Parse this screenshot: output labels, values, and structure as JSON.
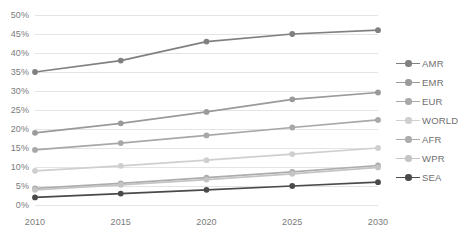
{
  "chart_data": {
    "type": "line",
    "title": "",
    "xlabel": "",
    "ylabel": "",
    "categories": [
      "2010",
      "2015",
      "2020",
      "2025",
      "2030"
    ],
    "x": [
      2010,
      2015,
      2020,
      2025,
      2030
    ],
    "ylim": [
      0,
      50
    ],
    "ytick_labels": [
      "0%",
      "5%",
      "10%",
      "15%",
      "20%",
      "25%",
      "30%",
      "35%",
      "40%",
      "45%",
      "50%"
    ],
    "ytick_values": [
      0,
      5,
      10,
      15,
      20,
      25,
      30,
      35,
      40,
      45,
      50
    ],
    "grid": true,
    "legend_position": "right",
    "series": [
      {
        "name": "AMR",
        "color": "#808080",
        "values": [
          35.0,
          38.0,
          43.0,
          45.0,
          46.0
        ]
      },
      {
        "name": "EMR",
        "color": "#9a9a9a",
        "values": [
          19.0,
          21.5,
          24.5,
          27.8,
          29.6
        ]
      },
      {
        "name": "EUR",
        "color": "#a8a8a8",
        "values": [
          14.5,
          16.3,
          18.3,
          20.4,
          22.4
        ]
      },
      {
        "name": "WORLD",
        "color": "#cfcfcf",
        "values": [
          9.0,
          10.3,
          11.8,
          13.4,
          15.0
        ]
      },
      {
        "name": "AFR",
        "color": "#acacac",
        "values": [
          4.4,
          5.7,
          7.2,
          8.7,
          10.4
        ]
      },
      {
        "name": "WPR",
        "color": "#c4c4c4",
        "values": [
          4.0,
          5.3,
          6.7,
          8.2,
          9.9
        ]
      },
      {
        "name": "SEA",
        "color": "#4a4a4a",
        "values": [
          2.0,
          3.0,
          4.0,
          5.0,
          6.0
        ]
      }
    ]
  },
  "axis": {
    "ytick_labels": [
      "50%",
      "45%",
      "40%",
      "35%",
      "30%",
      "25%",
      "20%",
      "15%",
      "10%",
      "5%",
      "0%"
    ],
    "xtick_labels": [
      "2010",
      "2015",
      "2020",
      "2025",
      "2030"
    ]
  },
  "legend": {
    "items": [
      {
        "label": "AMR"
      },
      {
        "label": "EMR"
      },
      {
        "label": "EUR"
      },
      {
        "label": "WORLD"
      },
      {
        "label": "AFR"
      },
      {
        "label": "WPR"
      },
      {
        "label": "SEA"
      }
    ]
  },
  "colors": {
    "gridline": "#e4e4e4",
    "axis_text": "#7b7b7b",
    "background": "#ffffff"
  }
}
